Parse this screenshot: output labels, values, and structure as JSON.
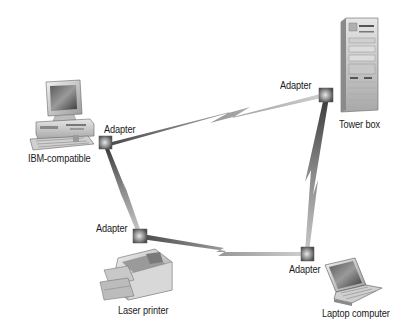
{
  "diagram": {
    "type": "network-topology",
    "colors": {
      "background": "#ffffff",
      "link": "#7a7a7a",
      "adapter": "#6a6a6a",
      "text": "#1a1a1a"
    },
    "nodes": [
      {
        "id": "ibm",
        "label": "IBM-compatible",
        "icon": "desktop-computer-icon",
        "adapter_label": "Adapter"
      },
      {
        "id": "tower",
        "label": "Tower box",
        "icon": "tower-server-icon",
        "adapter_label": "Adapter"
      },
      {
        "id": "laptop",
        "label": "Laptop computer",
        "icon": "laptop-icon",
        "adapter_label": "Adapter"
      },
      {
        "id": "printer",
        "label": "Laser printer",
        "icon": "laser-printer-icon",
        "adapter_label": "Adapter"
      }
    ],
    "links": [
      {
        "from": "ibm",
        "to": "tower",
        "style": "lightning"
      },
      {
        "from": "tower",
        "to": "laptop",
        "style": "lightning"
      },
      {
        "from": "laptop",
        "to": "printer",
        "style": "lightning"
      },
      {
        "from": "printer",
        "to": "ibm",
        "style": "lightning"
      }
    ]
  }
}
